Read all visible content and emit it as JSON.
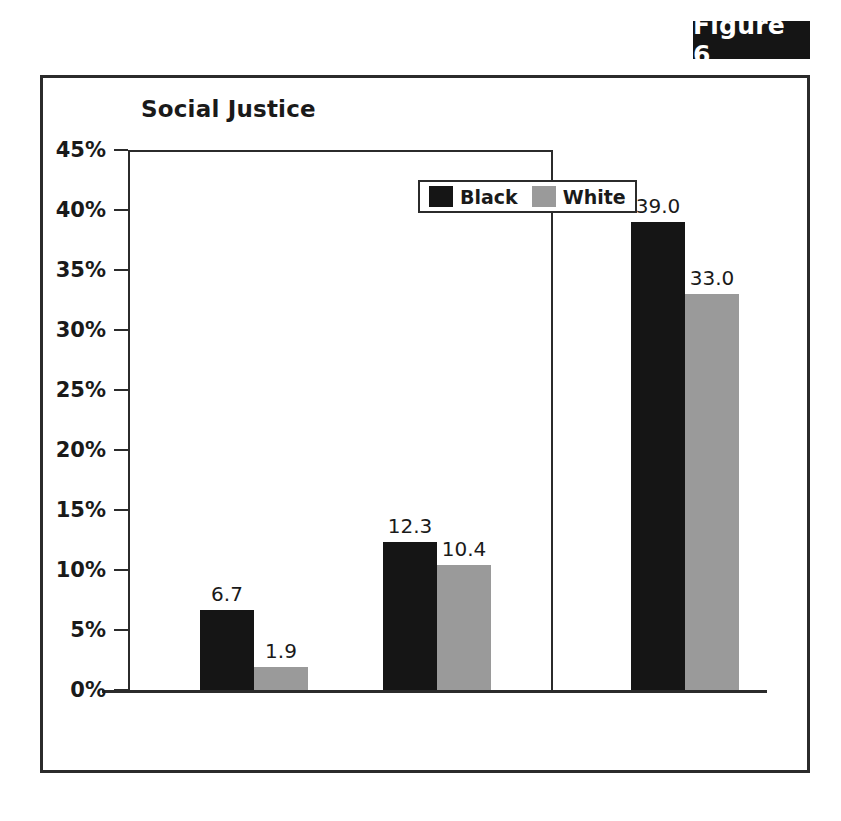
{
  "figure": {
    "tag_label": "Figure 6"
  },
  "chart_data": {
    "type": "bar",
    "title": "Social Justice",
    "xlabel": "",
    "ylabel": "",
    "grid": false,
    "legend_position": "top-center",
    "categories": [
      "Arrests",
      "Stopped while\ndriving",
      "Average sentence\nin months"
    ],
    "series": [
      {
        "name": "Black",
        "color": "#151515",
        "values": [
          6.7,
          12.3,
          39.0
        ]
      },
      {
        "name": "White",
        "color": "#9a9a9a",
        "values": [
          1.9,
          10.4,
          33.0
        ]
      }
    ],
    "value_labels": [
      [
        "6.7",
        "1.9"
      ],
      [
        "12.3",
        "10.4"
      ],
      [
        "39.0",
        "33.0"
      ]
    ],
    "yticks": [
      "0%",
      "5%",
      "10%",
      "15%",
      "20%",
      "25%",
      "30%",
      "35%",
      "40%",
      "45%"
    ],
    "ytick_values": [
      0,
      5,
      10,
      15,
      20,
      25,
      30,
      35,
      40,
      45
    ],
    "ylim": [
      0,
      45
    ]
  },
  "legend": {
    "items": [
      {
        "label": "Black",
        "swatch": "black-swatch"
      },
      {
        "label": "White",
        "swatch": "gray-swatch"
      }
    ]
  }
}
